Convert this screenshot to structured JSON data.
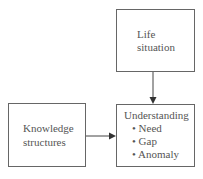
{
  "diagram": {
    "nodes": [
      {
        "id": "life",
        "lines": [
          "Life",
          "situation"
        ]
      },
      {
        "id": "knowledge",
        "lines": [
          "Knowledge",
          "structures"
        ]
      },
      {
        "id": "understanding",
        "title": "Understanding",
        "bullets": [
          "Need",
          "Gap",
          "Anomaly"
        ]
      }
    ],
    "edges": [
      {
        "from": "life",
        "to": "understanding"
      },
      {
        "from": "knowledge",
        "to": "understanding"
      }
    ],
    "bullet_char": "•"
  }
}
